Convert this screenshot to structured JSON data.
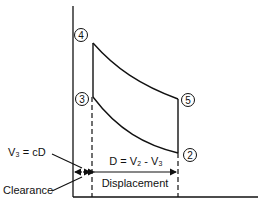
{
  "diagram": {
    "type": "pressure-volume cycle diagram",
    "points": [
      {
        "id": "4",
        "label": "4"
      },
      {
        "id": "3",
        "label": "3"
      },
      {
        "id": "5",
        "label": "5"
      },
      {
        "id": "2",
        "label": "2"
      }
    ],
    "annotations": {
      "clearance_volume": "V₃ = cD",
      "clearance": "Clearance",
      "displacement_formula": "D = V₂ - V₃",
      "displacement": "Displacement"
    }
  },
  "colors": {
    "line": "#111111",
    "background": "#ffffff"
  }
}
